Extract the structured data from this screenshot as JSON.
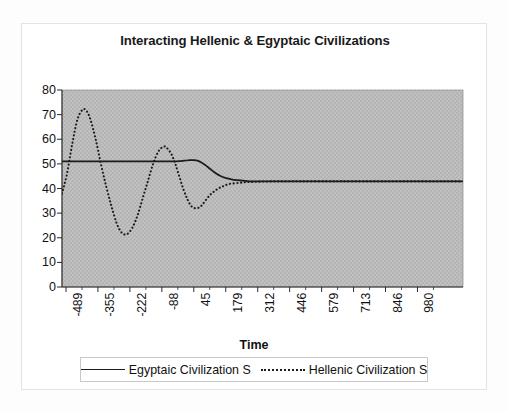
{
  "chart_data": {
    "type": "line",
    "title": "Interacting Hellenic & Egyptaic Civilizations",
    "xlabel": "Time",
    "ylabel": "",
    "ylim": [
      0,
      80
    ],
    "ytick_step": 10,
    "yticks": [
      "0",
      "10",
      "20",
      "30",
      "40",
      "50",
      "60",
      "70",
      "80"
    ],
    "xticks": [
      "-489",
      "-355",
      "-222",
      "-88",
      "45",
      "179",
      "312",
      "446",
      "579",
      "713",
      "846",
      "980"
    ],
    "xlim": [
      -489,
      1047
    ],
    "grid": false,
    "plot_background": "#bfbfbf",
    "legend_position": "bottom",
    "series": [
      {
        "name": "Egyptaic Civilization S",
        "style": "solid",
        "color": "#1b1b1b",
        "x": [
          -489,
          -440,
          -390,
          -340,
          -290,
          -240,
          -190,
          -140,
          -110,
          -88,
          -60,
          -40,
          -20,
          0,
          15,
          30,
          45,
          60,
          80,
          100,
          120,
          140,
          160,
          179,
          220,
          260,
          312,
          380,
          446,
          520,
          579,
          650,
          713,
          780,
          846,
          910,
          980,
          1047
        ],
        "values": [
          51,
          51,
          51,
          51,
          51,
          51,
          51,
          51,
          51,
          51,
          51,
          51.1,
          51.3,
          51.5,
          51.5,
          51.3,
          50.6,
          49.5,
          47.8,
          46.2,
          45.0,
          44.2,
          43.7,
          43.4,
          43.0,
          42.9,
          42.9,
          42.9,
          42.9,
          42.9,
          42.9,
          42.9,
          42.9,
          42.9,
          42.9,
          42.9,
          42.9,
          42.9
        ]
      },
      {
        "name": "Hellenic Civilization S",
        "style": "dotted",
        "color": "#1b1b1b",
        "x": [
          -489,
          -470,
          -450,
          -430,
          -410,
          -395,
          -380,
          -360,
          -340,
          -320,
          -300,
          -280,
          -260,
          -240,
          -220,
          -200,
          -180,
          -160,
          -140,
          -120,
          -100,
          -88,
          -70,
          -55,
          -40,
          -25,
          -10,
          5,
          20,
          35,
          45,
          60,
          75,
          90,
          110,
          130,
          150,
          179,
          210,
          240,
          270,
          312,
          360,
          410,
          446,
          520,
          579,
          650,
          713,
          780,
          846,
          910,
          980,
          1047
        ],
        "values": [
          38,
          46,
          58,
          68,
          72,
          71.5,
          68,
          60,
          50,
          41,
          33,
          26,
          22,
          21.5,
          24,
          29,
          36,
          43,
          50,
          55,
          57,
          56.5,
          54,
          50,
          45,
          40,
          36,
          33,
          32,
          32.2,
          33,
          35,
          37,
          38.5,
          40,
          41,
          41.8,
          42.2,
          42.5,
          42.7,
          42.8,
          42.9,
          42.9,
          42.9,
          42.9,
          42.9,
          42.9,
          42.9,
          42.9,
          42.9,
          42.9,
          42.9,
          42.9,
          42.9
        ]
      }
    ],
    "annotations": []
  },
  "legend": {
    "entries": [
      {
        "label": "Egyptaic Civilization S",
        "style": "solid"
      },
      {
        "label": "Hellenic Civilization S",
        "style": "dotted"
      }
    ]
  }
}
